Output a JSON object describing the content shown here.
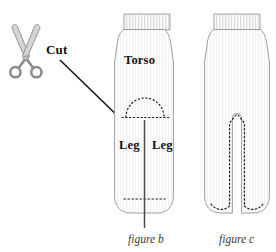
{
  "figure": {
    "colors": {
      "ink": "#111111",
      "sock_outline": "#9a9a9a",
      "sock_fill": "#fdfdfd",
      "rib_line": "#c9c9c9",
      "texture_line": "#ededed",
      "dotted_guide": "#1a1a1a",
      "cut_line": "#4a4a4a",
      "scissor_fill": "#d5d5d5",
      "scissor_outline": "#8a8a8a",
      "caption_text": "#3a3a3a"
    }
  },
  "annotations": {
    "cut_label": "Cut",
    "scissors_icon": "scissors-icon",
    "arrow_icon": "arrow-pointer-icon"
  },
  "figure_b": {
    "caption": "figure b",
    "labels": {
      "torso": "Torso",
      "leg_left": "Leg",
      "leg_right": "Leg"
    },
    "guides": {
      "crotch_arc": "dotted-semicircle",
      "crotch_baseline": "dotted-horizontal",
      "toe_line": "dotted-horizontal",
      "cut_line": "solid-vertical"
    }
  },
  "figure_c": {
    "caption": "figure c",
    "guides": {
      "slit": "open-vertical-slit",
      "stitch_left": "dashed-stitch-line",
      "stitch_right": "dashed-stitch-line",
      "toe_stitch": "dashed-curve"
    }
  }
}
